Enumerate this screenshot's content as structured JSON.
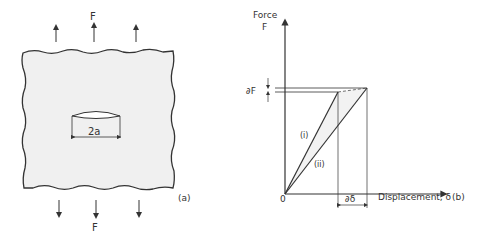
{
  "panel_a": {
    "force_top_label": "F",
    "force_bottom_label": "F",
    "crack_label": "2a",
    "panel_label": "(a)",
    "plate_fill": "#f0f0f0",
    "stroke_color": "#333333"
  },
  "panel_b": {
    "y_axis_label_line1": "Force",
    "y_axis_label_line2": "F",
    "x_axis_label": "Displacement, δ",
    "origin_label": "0",
    "dF_label": "∂F",
    "d_delta_label": "∂δ",
    "line_i_label": "(i)",
    "line_ii_label": "(ii)",
    "panel_label": "(b)",
    "shaded_fill": "#f2f2f2"
  }
}
